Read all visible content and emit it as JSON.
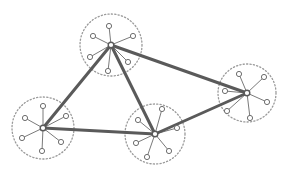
{
  "diagram": {
    "type": "network-topology",
    "colors": {
      "background": "#ffffff",
      "backbone": "#5a5a5a",
      "spoke": "#7a7a7a",
      "leaf_stroke": "#6e6e6e",
      "boundary": "#9a9a9a"
    },
    "clusters": [
      {
        "id": "A",
        "name": "top",
        "hub": [
          111,
          45
        ],
        "radius": 31,
        "leaves": [
          [
            109,
            26
          ],
          [
            93,
            36
          ],
          [
            133,
            36
          ],
          [
            90,
            57
          ],
          [
            128,
            62
          ],
          [
            108,
            71
          ]
        ]
      },
      {
        "id": "B",
        "name": "left",
        "hub": [
          43,
          128
        ],
        "radius": 31,
        "leaves": [
          [
            43,
            106
          ],
          [
            25,
            118
          ],
          [
            66,
            116
          ],
          [
            22,
            138
          ],
          [
            61,
            142
          ],
          [
            42,
            151
          ]
        ]
      },
      {
        "id": "C",
        "name": "bottom-center",
        "hub": [
          155,
          134
        ],
        "radius": 30,
        "leaves": [
          [
            162,
            109
          ],
          [
            138,
            120
          ],
          [
            177,
            128
          ],
          [
            136,
            143
          ],
          [
            169,
            151
          ],
          [
            147,
            157
          ]
        ]
      },
      {
        "id": "D",
        "name": "right",
        "hub": [
          247,
          93
        ],
        "radius": 29,
        "leaves": [
          [
            239,
            74
          ],
          [
            264,
            77
          ],
          [
            225,
            91
          ],
          [
            267,
            102
          ],
          [
            227,
            111
          ],
          [
            250,
            118
          ]
        ]
      }
    ],
    "links": [
      [
        "A",
        "B"
      ],
      [
        "A",
        "C"
      ],
      [
        "A",
        "D"
      ],
      [
        "B",
        "C"
      ],
      [
        "C",
        "D"
      ]
    ]
  }
}
